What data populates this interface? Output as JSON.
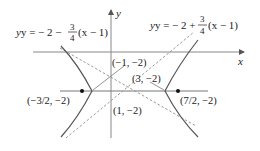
{
  "diagram": {
    "type": "hyperbola-graph",
    "axes": {
      "x_label": "x",
      "y_label": "y"
    },
    "asymptotes": [
      {
        "name": "left-asymptote",
        "prefix": "y = − 2 − ",
        "frac_num": "3",
        "frac_den": "4",
        "suffix": "(x − 1)"
      },
      {
        "name": "right-asymptote",
        "prefix": "y = − 2 + ",
        "frac_num": "3",
        "frac_den": "4",
        "suffix": "(x − 1)"
      }
    ],
    "points": {
      "left_vertex": "(−1, −2)",
      "right_vertex": "(3, −2)",
      "center": "(1, −2)",
      "left_focus": "(−3/2, −2)",
      "right_focus": "(7/2, −2)"
    },
    "colors": {
      "curve": "#555555",
      "axis": "#777777",
      "asymptote": "#999999",
      "text": "#222222"
    }
  }
}
